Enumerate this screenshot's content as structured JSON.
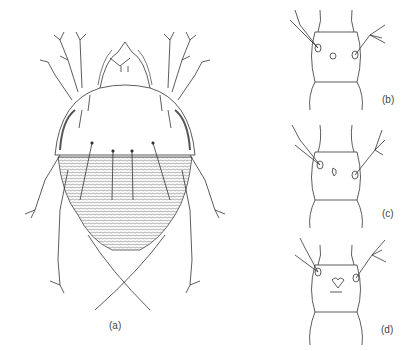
{
  "figure": {
    "panels": [
      {
        "id": "a",
        "label": "(a)",
        "description": "mite dorsal view, whole body"
      },
      {
        "id": "b",
        "label": "(b)",
        "description": "segment detail with setae"
      },
      {
        "id": "c",
        "label": "(c)",
        "description": "segment detail with setae"
      },
      {
        "id": "d",
        "label": "(d)",
        "description": "segment detail with setae"
      }
    ],
    "colors": {
      "line": "#333333",
      "stipple": "#888888",
      "background": "#ffffff"
    }
  }
}
